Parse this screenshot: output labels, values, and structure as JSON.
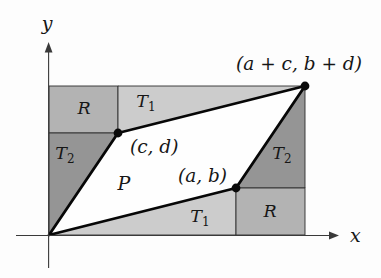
{
  "figure": {
    "axes": {
      "x_label": "x",
      "y_label": "y"
    },
    "points": {
      "cd_label": "(c, d)",
      "ab_label": "(a, b)",
      "sum_label": "(a + c, b + d)"
    },
    "regions": {
      "parallelogram_label": "P",
      "rectangle_label": "R",
      "triangle_base": "T",
      "triangle1_sub": "1",
      "triangle2_sub": "2"
    },
    "colors": {
      "t1_fill": "#cccccc",
      "t2_fill": "#959595",
      "r_fill": "#b3b3b3",
      "p_fill": "#fefefe"
    }
  }
}
